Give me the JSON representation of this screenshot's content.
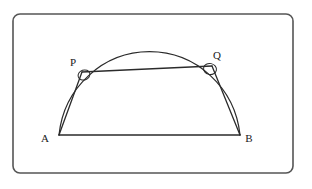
{
  "figure": {
    "background_color": "#ffffff",
    "stroke_color": "#2b2b2b",
    "frame": {
      "name": "rounded-rectangle-border",
      "x": 13,
      "y": 14,
      "width": 280,
      "height": 159,
      "corner_radius": 7,
      "stroke_width": 1.6,
      "stroke_color": "#555555",
      "fill": "#ffffff"
    },
    "points": {
      "A": {
        "label": "A",
        "x": 59,
        "y": 135,
        "label_x": 45,
        "label_y": 139
      },
      "B": {
        "label": "B",
        "x": 240,
        "y": 135,
        "label_x": 247,
        "label_y": 139
      },
      "P": {
        "label": "P",
        "x": 82,
        "y": 72,
        "label_x": 70,
        "label_y": 67
      },
      "Q": {
        "label": "Q",
        "x": 212,
        "y": 66,
        "label_x": 214,
        "label_y": 60
      }
    },
    "arc": {
      "name": "semicircular-arc-AB",
      "center_x": 150,
      "center_y": 135,
      "radius_x": 91,
      "radius_y": 93,
      "start_x": 59,
      "start_y": 135,
      "end_x": 240,
      "end_y": 135,
      "apex_x": 150,
      "apex_y": 42
    },
    "segments": [
      {
        "name": "segment-AB",
        "from": "A",
        "to": "B",
        "x1": 59,
        "y1": 135,
        "x2": 240,
        "y2": 135
      },
      {
        "name": "segment-AP",
        "from": "A",
        "to": "P",
        "x1": 59,
        "y1": 135,
        "x2": 82,
        "y2": 72
      },
      {
        "name": "segment-PQ",
        "from": "P",
        "to": "Q",
        "x1": 82,
        "y1": 72,
        "x2": 212,
        "y2": 66
      },
      {
        "name": "segment-QB",
        "from": "Q",
        "to": "B",
        "x1": 212,
        "y1": 66,
        "x2": 240,
        "y2": 135
      }
    ],
    "angle_marks": [
      {
        "name": "angle-mark-P",
        "vertex": "P",
        "cx": 84,
        "cy": 75,
        "rx": 6,
        "ry": 5,
        "rotation": -18
      },
      {
        "name": "angle-mark-Q",
        "vertex": "Q",
        "cx": 210,
        "cy": 69,
        "rx": 6.5,
        "ry": 5.5,
        "rotation": 12
      }
    ]
  }
}
